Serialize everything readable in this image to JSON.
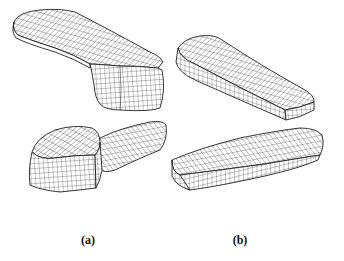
{
  "figure": {
    "panels": [
      {
        "id": "a",
        "label": "(a)",
        "views": [
          {
            "name": "mesh-handle-view-top",
            "description": "wireframe mesh of L-shaped body with long flat arm and tall block end"
          },
          {
            "name": "mesh-handle-view-bottom",
            "description": "wireframe mesh of L-shaped body viewed from other side, block in front"
          }
        ]
      },
      {
        "id": "b",
        "label": "(b)",
        "views": [
          {
            "name": "mesh-tapered-block-view-top",
            "description": "wireframe mesh of tapered rounded rectangular block"
          },
          {
            "name": "mesh-tapered-block-view-bottom",
            "description": "wireframe mesh of tapered rounded rectangular block, rotated"
          }
        ]
      }
    ],
    "colors": {
      "background": "#ffffff",
      "lines": "#2a2a2a"
    }
  }
}
